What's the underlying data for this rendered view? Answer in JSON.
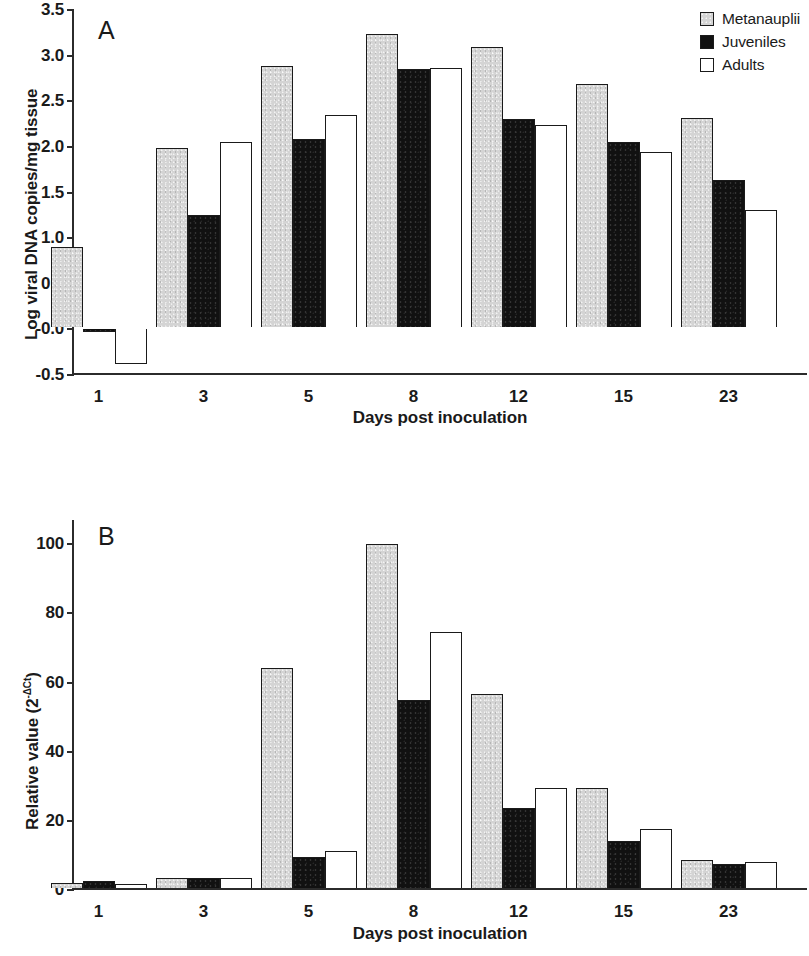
{
  "figure": {
    "series_names": [
      "Metanauplii",
      "Juveniles",
      "Adults"
    ],
    "colors": {
      "metanauplii": "#d4d4d4",
      "juveniles": "#111111",
      "adults": "#ffffff",
      "outline": "#1a1a1a",
      "axis": "#2b2b2b"
    }
  },
  "legend": {
    "position": "top-right",
    "items": [
      {
        "label": "Metanauplii",
        "swatch": "gray"
      },
      {
        "label": "Juveniles",
        "swatch": "black"
      },
      {
        "label": "Adults",
        "swatch": "white"
      }
    ]
  },
  "chart_data": [
    {
      "type": "bar",
      "panel": "A",
      "title": "",
      "xlabel": "Days post inoculation",
      "ylabel": "Log viral DNA copies/mg tissue",
      "categories": [
        "1",
        "3",
        "5",
        "8",
        "12",
        "15",
        "23"
      ],
      "ylim": [
        -0.5,
        3.5
      ],
      "yticks": [
        "3.5",
        "3.0",
        "2.5",
        "2.0",
        "1.5",
        "1.0",
        "0.5",
        "-0.0",
        "-0.5"
      ],
      "ytick_values": [
        3.5,
        3.0,
        2.5,
        2.0,
        1.5,
        1.0,
        0.5,
        0.0,
        -0.5
      ],
      "grid": false,
      "legend": "top-right",
      "series": [
        {
          "name": "Metanauplii",
          "values": [
            0.88,
            1.97,
            2.87,
            3.22,
            3.07,
            2.67,
            2.29
          ]
        },
        {
          "name": "Juveniles",
          "values": [
            -0.03,
            1.23,
            2.06,
            2.83,
            2.28,
            2.03,
            1.62
          ]
        },
        {
          "name": "Adults",
          "values": [
            -0.38,
            2.03,
            2.33,
            2.84,
            2.22,
            1.92,
            1.29
          ]
        }
      ]
    },
    {
      "type": "bar",
      "panel": "B",
      "title": "",
      "xlabel": "Days post inoculation",
      "ylabel": "Relative value (2",
      "ylabel_sup": "-ΔCt",
      "ylabel_tail": ")",
      "categories": [
        "1",
        "3",
        "5",
        "8",
        "12",
        "15",
        "23"
      ],
      "ylim": [
        0,
        107
      ],
      "yticks": [
        "100",
        "80",
        "60",
        "40",
        "20",
        "0"
      ],
      "ytick_values": [
        100,
        80,
        60,
        40,
        20,
        0
      ],
      "grid": false,
      "legend": "none",
      "series": [
        {
          "name": "Metanauplii",
          "values": [
            1.5,
            3.0,
            63.5,
            99.5,
            56.0,
            29.0,
            8.0
          ]
        },
        {
          "name": "Juveniles",
          "values": [
            2.0,
            3.0,
            9.0,
            54.5,
            23.0,
            13.5,
            7.0
          ]
        },
        {
          "name": "Adults",
          "values": [
            1.3,
            2.8,
            10.8,
            74.0,
            29.0,
            17.0,
            7.5
          ]
        }
      ]
    }
  ]
}
